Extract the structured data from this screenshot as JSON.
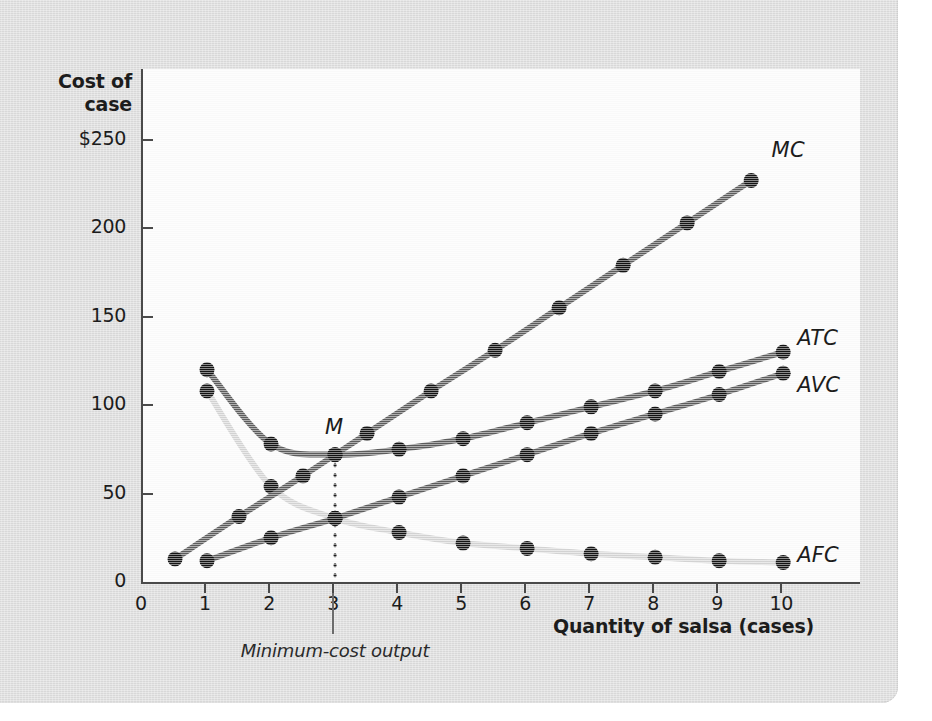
{
  "axes": {
    "y_title": "Cost of case",
    "y_title_line1": "Cost of",
    "y_title_line2": "case",
    "x_title": "Quantity of salsa (cases)",
    "y_ticks": [
      "$250",
      "200",
      "150",
      "100",
      "50",
      "0"
    ],
    "y_tick_values": [
      250,
      200,
      150,
      100,
      50,
      0
    ],
    "x_ticks": [
      "1",
      "2",
      "3",
      "4",
      "5",
      "6",
      "7",
      "8",
      "9",
      "10"
    ],
    "x_tick_values": [
      1,
      2,
      3,
      4,
      5,
      6,
      7,
      8,
      9,
      10
    ],
    "y_min": 0,
    "y_max": 290,
    "x_min": 0,
    "x_max": 11.2
  },
  "annotations": {
    "min_point_label": "M",
    "min_cost_caption": "Minimum-cost output",
    "min_cost_quantity": 3
  },
  "colors": {
    "background": "#dedede",
    "plot_background": "#fbfbfb",
    "axis": "#4a4a4a",
    "dark_curve": "#5d5d5d",
    "light_curve": "#d4d4d4",
    "marker": "#141414",
    "text": "#1c1c1c"
  },
  "chart_data": {
    "type": "line",
    "title": "",
    "xlabel": "Quantity of salsa (cases)",
    "ylabel": "Cost of case",
    "xlim": [
      0,
      11.2
    ],
    "ylim": [
      0,
      290
    ],
    "grid": false,
    "legend": "inline-right-of-curve",
    "series": [
      {
        "name": "MC",
        "label": "MC",
        "color": "#5d5d5d",
        "label_x": 9.85,
        "label_y": 243,
        "x": [
          0.5,
          1.5,
          2.5,
          3.5,
          4.5,
          5.5,
          6.5,
          7.5,
          8.5,
          9.5
        ],
        "values": [
          13,
          37,
          60,
          84,
          108,
          131,
          155,
          179,
          203,
          227
        ]
      },
      {
        "name": "ATC",
        "label": "ATC",
        "color": "#5d5d5d",
        "label_x": 10.25,
        "label_y": 137,
        "x": [
          1,
          2,
          3,
          4,
          5,
          6,
          7,
          8,
          9,
          10
        ],
        "values": [
          120,
          78,
          72,
          75,
          81,
          90,
          99,
          108,
          119,
          130
        ]
      },
      {
        "name": "AVC",
        "label": "AVC",
        "color": "#5d5d5d",
        "label_x": 10.25,
        "label_y": 110,
        "x": [
          1,
          2,
          3,
          4,
          5,
          6,
          7,
          8,
          9,
          10
        ],
        "values": [
          12,
          25,
          36,
          48,
          60,
          72,
          84,
          95,
          106,
          118
        ]
      },
      {
        "name": "AFC",
        "label": "AFC",
        "color": "#d4d4d4",
        "label_x": 10.25,
        "label_y": 14,
        "x": [
          1,
          2,
          3,
          4,
          5,
          6,
          7,
          8,
          9,
          10
        ],
        "values": [
          108,
          54,
          36,
          28,
          22,
          19,
          16,
          14,
          12,
          11
        ]
      }
    ]
  }
}
